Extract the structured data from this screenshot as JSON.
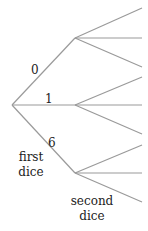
{
  "diagram": {
    "type": "tree",
    "line_color": "#9a9a9a",
    "text_color": "#222222",
    "root": {
      "x": 12,
      "y": 105
    },
    "first_level": [
      {
        "label": "0",
        "node": {
          "x": 75,
          "y": 38
        },
        "children_y": [
          8,
          38,
          67
        ]
      },
      {
        "label": "1",
        "node": {
          "x": 75,
          "y": 105
        },
        "children_y": [
          77,
          105,
          134
        ]
      },
      {
        "label": "6",
        "node": {
          "x": 75,
          "y": 173
        },
        "children_y": [
          145,
          173,
          202
        ]
      }
    ],
    "leaf_x": 142,
    "labels": {
      "branch_0": "0",
      "branch_1": "1",
      "branch_6": "6",
      "first_line1": "first",
      "first_line2": "dice",
      "second_line1": "second",
      "second_line2": "dice"
    }
  }
}
